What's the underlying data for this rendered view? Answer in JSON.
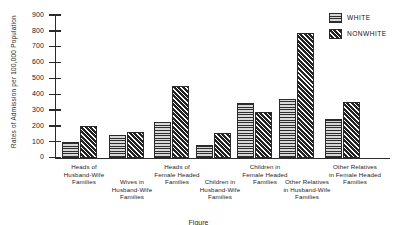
{
  "chart_data": {
    "type": "bar",
    "title": "",
    "xlabel": "",
    "ylabel": "Rates of Admission per 100,000 Population",
    "ylim": [
      0,
      900
    ],
    "ytick_step": 100,
    "yticks": [
      "900",
      "800",
      "700",
      "600",
      "500",
      "400",
      "300",
      "200",
      "100",
      "0"
    ],
    "grid": false,
    "legend_position": "top-right",
    "categories": [
      "Heads of\nHusband-Wife\nFamilies",
      "Wives in\nHusband-Wife\nFamilies",
      "Heads of\nFemale Headed\nFamilies",
      "Children in\nHusband-Wife\nFamilies",
      "Children in\nFemale Headed\nFamilies",
      "Other Relatives\nin Husband-Wife\nFamilies",
      "Other Relatives\nin Female Headed\nFamilies"
    ],
    "series": [
      {
        "name": "WHITE",
        "values": [
          100,
          145,
          225,
          80,
          350,
          370,
          245
        ]
      },
      {
        "name": "NONWHITE",
        "values": [
          200,
          165,
          455,
          155,
          290,
          790,
          355
        ]
      }
    ]
  },
  "legend": {
    "items": [
      {
        "label": "WHITE",
        "pattern": "horizontal-lines"
      },
      {
        "label": "NONWHITE",
        "pattern": "diagonal-hatch"
      }
    ]
  },
  "caption": "Figure"
}
